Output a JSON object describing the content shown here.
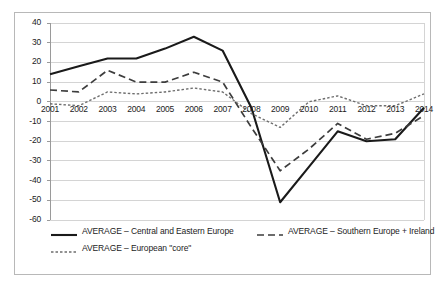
{
  "chart_data": {
    "type": "line",
    "title": "",
    "subtitle": "",
    "xlabel": "",
    "ylabel": "",
    "categories": [
      "2001",
      "2002",
      "2003",
      "2004",
      "2005",
      "2006",
      "2007",
      "2008",
      "2009",
      "2010",
      "2011",
      "2012",
      "2013",
      "2014"
    ],
    "x": [
      2001,
      2002,
      2003,
      2004,
      2005,
      2006,
      2007,
      2008,
      2009,
      2010,
      2011,
      2012,
      2013,
      2014
    ],
    "ylim": [
      -60,
      40
    ],
    "xlim": [
      2001,
      2014
    ],
    "yticks": [
      40,
      30,
      20,
      10,
      0,
      -10,
      -20,
      -30,
      -40,
      -50,
      -60
    ],
    "ytick_labels": [
      "40",
      "30",
      "20",
      "10",
      "0",
      "-10",
      "-20",
      "-30",
      "-40",
      "-50",
      "-60"
    ],
    "grid": true,
    "grid_axis": "y",
    "legend_position": "bottom",
    "series": [
      {
        "name": "AVERAGE – Central and Eastern Europe",
        "style": "solid",
        "color": "#1a1a1a",
        "values": [
          14,
          18,
          22,
          22,
          27,
          33,
          26,
          -3,
          -51,
          -33,
          -15,
          -20,
          -19,
          -3
        ]
      },
      {
        "name": "AVERAGE – Southern Europe + Ireland",
        "style": "dashed",
        "color": "#3d3d3d",
        "values": [
          6,
          5,
          16,
          10,
          10,
          15,
          10,
          -13,
          -35,
          -24,
          -11,
          -19,
          -16,
          -7
        ]
      },
      {
        "name": "AVERAGE – European \"core\"",
        "style": "dotted",
        "color": "#6e6e6e",
        "values": [
          -1,
          -2,
          5,
          4,
          5,
          7,
          5,
          -6,
          -13,
          0,
          3,
          -2,
          -2,
          4
        ]
      }
    ]
  },
  "legend": {
    "entries": [
      {
        "label": "AVERAGE – Central and Eastern Europe",
        "style": "solid"
      },
      {
        "label": "AVERAGE – Southern Europe + Ireland",
        "style": "dashed"
      },
      {
        "label": "AVERAGE – European \"core\"",
        "style": "dotted"
      }
    ]
  },
  "colors": {
    "frame": "#b8b8b8",
    "grid": "#d4d4d4",
    "axis": "#9a9a9a",
    "series_solid": "#1a1a1a",
    "series_dashed": "#3d3d3d",
    "series_dotted": "#6e6e6e",
    "text": "#1c1c1c",
    "background": "#ffffff"
  }
}
